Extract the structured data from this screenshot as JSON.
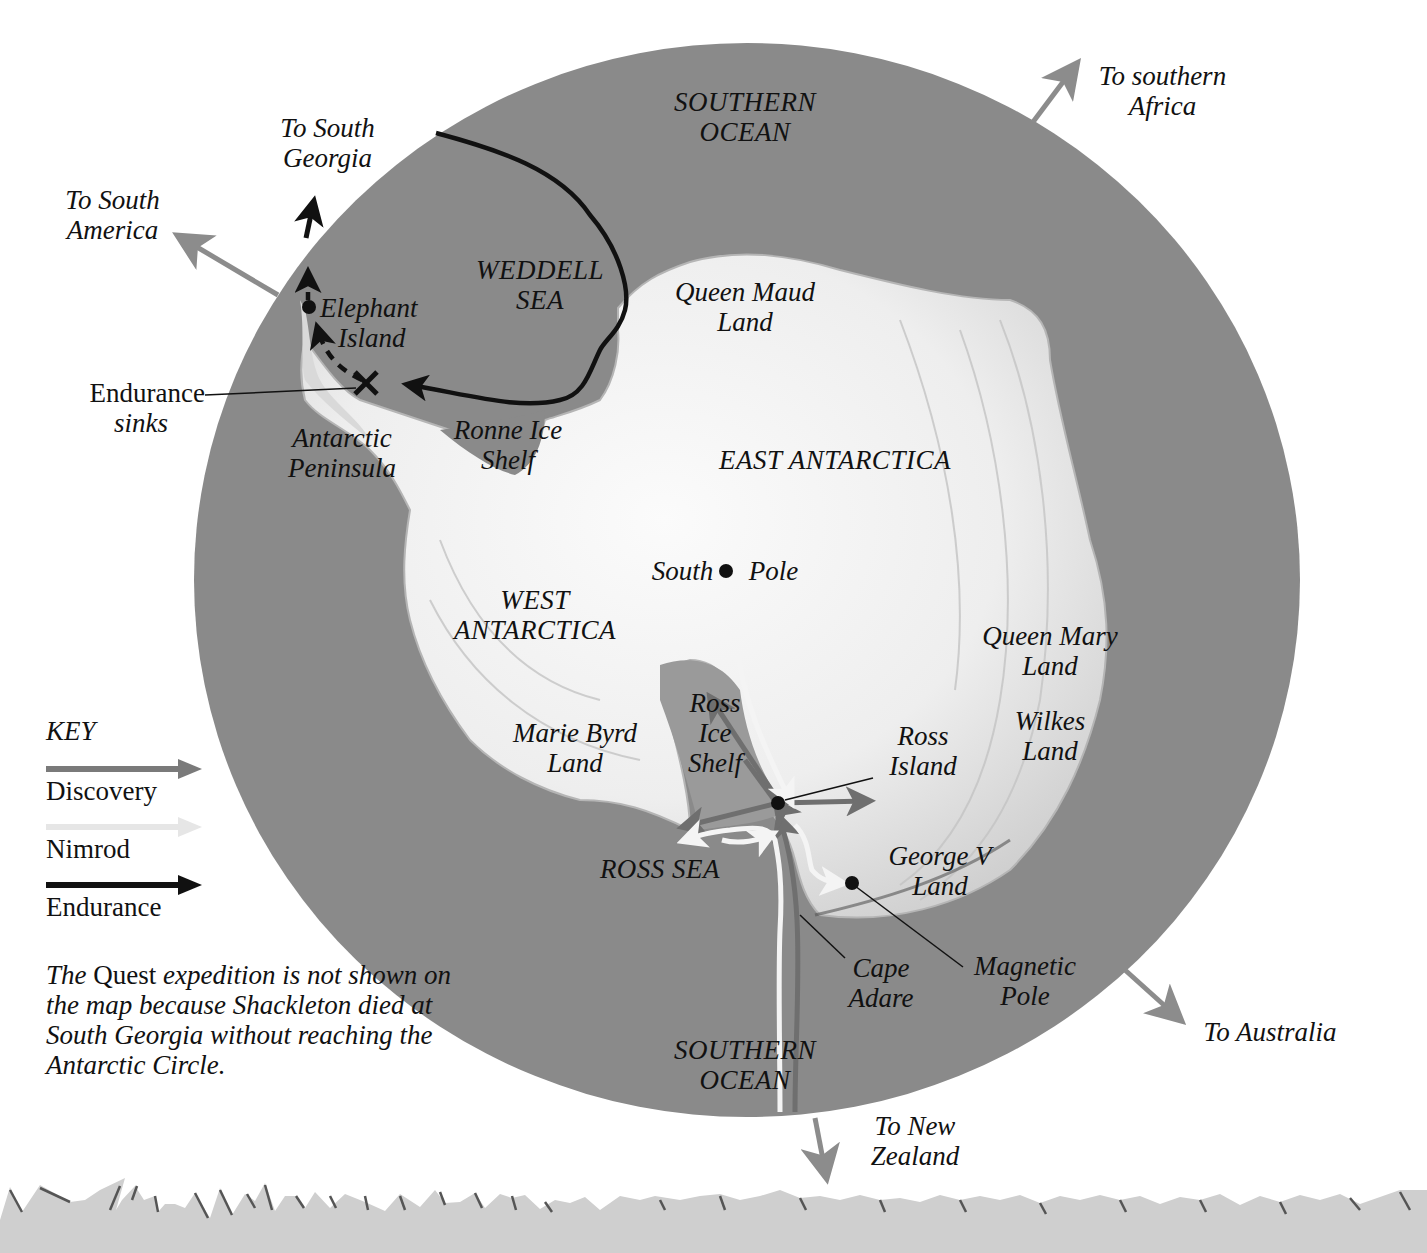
{
  "colors": {
    "ocean": "#8a8a8a",
    "ice": "#ececec",
    "ice_shadow": "#c9c9c9",
    "discovery": "#7a7a7a",
    "nimrod": "#f2f2f2",
    "endurance": "#111111",
    "external_arrow": "#8c8c8c",
    "ground": "#cfcfcf"
  },
  "map": {
    "type": "Polar map of Antarctica showing Shackleton's expedition routes",
    "ocean_labels": {
      "north": [
        "SOUTHERN",
        "OCEAN"
      ],
      "south": [
        "SOUTHERN",
        "OCEAN"
      ]
    },
    "regions": {
      "weddell_sea": [
        "WEDDELL",
        "SEA"
      ],
      "ross_sea": "ROSS SEA",
      "east_antarctica": "EAST ANTARCTICA",
      "west_antarctica": [
        "WEST",
        "ANTARCTICA"
      ],
      "queen_maud_land": [
        "Queen Maud",
        "Land"
      ],
      "queen_mary_land": [
        "Queen Mary",
        "Land"
      ],
      "wilkes_land": [
        "Wilkes",
        "Land"
      ],
      "marie_byrd_land": [
        "Marie Byrd",
        "Land"
      ],
      "george_v_land": [
        "George V",
        "Land"
      ],
      "ronne_ice_shelf": [
        "Ronne Ice",
        "Shelf"
      ],
      "ross_ice_shelf": [
        "Ross",
        "Ice",
        "Shelf"
      ],
      "antarctic_peninsula": [
        "Antarctic",
        "Peninsula"
      ]
    },
    "places": {
      "south_pole": {
        "left": "South",
        "right": "Pole"
      },
      "elephant_island": [
        "Elephant",
        "Island"
      ],
      "ross_island": [
        "Ross",
        "Island"
      ],
      "cape_adare": [
        "Cape",
        "Adare"
      ],
      "magnetic_pole": [
        "Magnetic",
        "Pole"
      ]
    },
    "annotations": {
      "endurance_sinks": {
        "line1": "Endurance",
        "line2": "sinks"
      }
    },
    "directions": {
      "south_georgia": [
        "To South",
        "Georgia"
      ],
      "south_america": [
        "To South",
        "America"
      ],
      "southern_africa": [
        "To southern",
        "Africa"
      ],
      "australia": "To Australia",
      "new_zealand": [
        "To New",
        "Zealand"
      ]
    }
  },
  "key": {
    "title": "KEY",
    "items": [
      {
        "label": "Discovery",
        "color": "#7a7a7a"
      },
      {
        "label": "Nimrod",
        "color": "#e6e6e6"
      },
      {
        "label": "Endurance",
        "color": "#111111"
      }
    ]
  },
  "note": {
    "part1": "The ",
    "ship": "Quest",
    "part2": " expedition is not shown on the map because Shackleton died at South Georgia without reaching the Antarctic Circle."
  }
}
